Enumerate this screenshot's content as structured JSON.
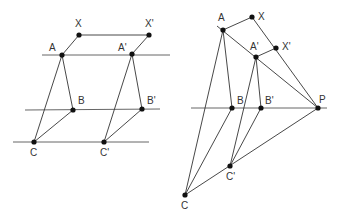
{
  "left_diagram": {
    "horizontal_lines": [
      {
        "name": "line-a",
        "x1": 42,
        "y1": 55,
        "x2": 170,
        "y2": 55
      },
      {
        "name": "line-b",
        "x1": 25,
        "y1": 110,
        "x2": 160,
        "y2": 109
      },
      {
        "name": "line-c",
        "x1": 13,
        "y1": 142,
        "x2": 149,
        "y2": 142
      }
    ],
    "points": [
      {
        "id": "X",
        "label": "X",
        "x": 79,
        "y": 35,
        "lx": 75,
        "ly": 27
      },
      {
        "id": "Xp",
        "label": "X'",
        "x": 149,
        "y": 35,
        "lx": 145,
        "ly": 27
      },
      {
        "id": "A",
        "label": "A",
        "x": 62,
        "y": 55,
        "lx": 49,
        "ly": 51
      },
      {
        "id": "Ap",
        "label": "A'",
        "x": 132,
        "y": 54,
        "lx": 118,
        "ly": 51
      },
      {
        "id": "B",
        "label": "B",
        "x": 73,
        "y": 110,
        "lx": 78,
        "ly": 104
      },
      {
        "id": "Bp",
        "label": "B'",
        "x": 142,
        "y": 109,
        "lx": 147,
        "ly": 104
      },
      {
        "id": "C",
        "label": "C",
        "x": 34,
        "y": 142,
        "lx": 30,
        "ly": 156
      },
      {
        "id": "Cp",
        "label": "C'",
        "x": 104,
        "y": 142,
        "lx": 100,
        "ly": 156
      }
    ],
    "segments": [
      [
        "X",
        "Xp"
      ],
      [
        "X",
        "A"
      ],
      [
        "Xp",
        "Ap"
      ],
      [
        "A",
        "B"
      ],
      [
        "A",
        "C"
      ],
      [
        "B",
        "C"
      ],
      [
        "Ap",
        "Bp"
      ],
      [
        "Ap",
        "Cp"
      ],
      [
        "Bp",
        "Cp"
      ]
    ]
  },
  "right_diagram": {
    "horizontal_lines": [
      {
        "name": "line-bp",
        "x1": 191,
        "y1": 108,
        "x2": 327,
        "y2": 108
      }
    ],
    "points": [
      {
        "id": "A",
        "label": "A",
        "x": 223,
        "y": 30,
        "lx": 218,
        "ly": 21
      },
      {
        "id": "X",
        "label": "X",
        "x": 252,
        "y": 17,
        "lx": 258,
        "ly": 20
      },
      {
        "id": "Ap",
        "label": "A'",
        "x": 256,
        "y": 57,
        "lx": 250,
        "ly": 50
      },
      {
        "id": "Xp",
        "label": "X'",
        "x": 276,
        "y": 48,
        "lx": 282,
        "ly": 50
      },
      {
        "id": "B",
        "label": "B",
        "x": 232,
        "y": 108,
        "lx": 237,
        "ly": 104
      },
      {
        "id": "Bp",
        "label": "B'",
        "x": 261,
        "y": 108,
        "lx": 265,
        "ly": 104
      },
      {
        "id": "P",
        "label": "P",
        "x": 318,
        "y": 108,
        "lx": 319,
        "ly": 103
      },
      {
        "id": "Cp",
        "label": "C'",
        "x": 230,
        "y": 166,
        "lx": 226,
        "ly": 180
      },
      {
        "id": "C",
        "label": "C",
        "x": 185,
        "y": 195,
        "lx": 181,
        "ly": 209
      }
    ],
    "segments": [
      [
        "A",
        "X"
      ],
      [
        "X",
        "P"
      ],
      [
        "Ap",
        "Xp"
      ],
      [
        "A",
        "B"
      ],
      [
        "A",
        "C"
      ],
      [
        "B",
        "C"
      ],
      [
        "Ap",
        "Bp"
      ],
      [
        "Ap",
        "Cp"
      ],
      [
        "Bp",
        "Cp"
      ],
      [
        "C",
        "P"
      ]
    ],
    "extended_lines": [
      {
        "name": "line-a-to-p",
        "x1": 217,
        "y1": 26,
        "x2": 318,
        "y2": 108
      }
    ]
  }
}
